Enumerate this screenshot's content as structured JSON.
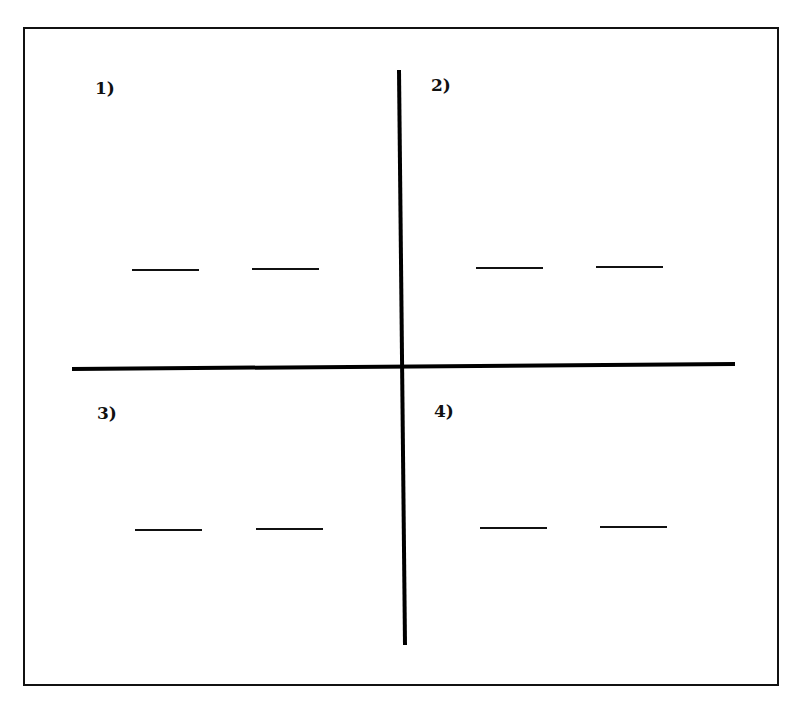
{
  "diagram": {
    "frame": {
      "x": 24,
      "y": 28,
      "w": 754,
      "h": 657,
      "stroke": "#111111"
    },
    "axes": {
      "horizontal": {
        "x1": 72,
        "y1": 369,
        "x2": 735,
        "y2": 364
      },
      "vertical": {
        "x1": 399,
        "y1": 70,
        "x2": 405,
        "y2": 645
      }
    },
    "quadrants": [
      {
        "label": "1)",
        "label_x": 95,
        "label_y": 94,
        "blanks": [
          {
            "x1": 132,
            "x2": 199,
            "y": 270
          },
          {
            "x1": 252,
            "x2": 319,
            "y": 269
          }
        ]
      },
      {
        "label": "2)",
        "label_x": 431,
        "label_y": 91,
        "blanks": [
          {
            "x1": 476,
            "x2": 543,
            "y": 268
          },
          {
            "x1": 596,
            "x2": 663,
            "y": 267
          }
        ]
      },
      {
        "label": "3)",
        "label_x": 97,
        "label_y": 419,
        "blanks": [
          {
            "x1": 135,
            "x2": 202,
            "y": 530
          },
          {
            "x1": 256,
            "x2": 323,
            "y": 529
          }
        ]
      },
      {
        "label": "4)",
        "label_x": 434,
        "label_y": 417,
        "blanks": [
          {
            "x1": 480,
            "x2": 547,
            "y": 528
          },
          {
            "x1": 600,
            "x2": 667,
            "y": 527
          }
        ]
      }
    ]
  }
}
